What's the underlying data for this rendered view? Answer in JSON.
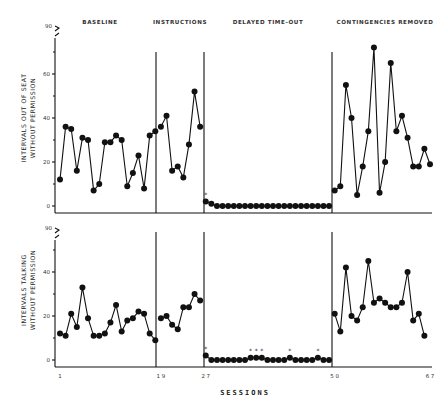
{
  "chart_data": [
    {
      "type": "line",
      "title": "",
      "xlabel": "SESSIONS",
      "ylabel": "INTERVALS OUT OF SEAT WITHOUT PERMISSION",
      "ylabel_lines": [
        "INTERVALS OUT OF SEAT",
        "WITHOUT PERMISSION"
      ],
      "y_ticks": [
        "0",
        "20",
        "40",
        "60"
      ],
      "y_break_label": "90",
      "ylim": [
        0,
        90
      ],
      "x_ticks": [
        "1",
        "19",
        "27",
        "50",
        "67"
      ],
      "phases": [
        "BASELINE",
        "INSTRUCTIONS",
        "DELAYED TIME-OUT",
        "CONTINGENCIES REMOVED"
      ],
      "phase_starts": [
        1,
        19,
        27,
        50
      ],
      "series": [
        {
          "name": "BASELINE",
          "x_start": 1,
          "values": [
            12,
            36,
            35,
            16,
            31,
            30,
            7,
            10,
            29,
            29,
            32,
            30,
            9,
            15,
            23,
            8,
            32,
            34
          ]
        },
        {
          "name": "INSTRUCTIONS",
          "x_start": 19,
          "values": [
            36,
            41,
            16,
            18,
            13,
            28,
            52,
            36
          ]
        },
        {
          "name": "DELAYED TIME-OUT",
          "x_start": 27,
          "values": [
            2,
            1,
            0,
            0,
            0,
            0,
            0,
            0,
            0,
            0,
            0,
            0,
            0,
            0,
            0,
            0,
            0,
            0,
            0,
            0,
            0,
            0,
            0
          ],
          "asterisks_at": [
            27
          ]
        },
        {
          "name": "CONTINGENCIES REMOVED",
          "x_start": 50,
          "values": [
            7,
            9,
            55,
            40,
            5,
            18,
            34,
            72,
            6,
            20,
            65,
            34,
            41,
            31,
            18,
            18,
            26,
            19
          ]
        }
      ]
    },
    {
      "type": "line",
      "title": "",
      "xlabel": "SESSIONS",
      "ylabel": "INTERVALS TALKING WITHOUT PERMISSION",
      "ylabel_lines": [
        "INTERVALS TALKING",
        "WITHOUT PERMISSION"
      ],
      "y_ticks": [
        "0",
        "20",
        "40"
      ],
      "y_break_label": "90",
      "ylim": [
        0,
        90
      ],
      "x_ticks": [
        "1",
        "19",
        "27",
        "50",
        "67"
      ],
      "phases": [
        "BASELINE",
        "INSTRUCTIONS",
        "DELAYED TIME-OUT",
        "CONTINGENCIES REMOVED"
      ],
      "phase_starts": [
        1,
        19,
        27,
        50
      ],
      "series": [
        {
          "name": "BASELINE",
          "x_start": 1,
          "values": [
            12,
            11,
            21,
            15,
            33,
            19,
            11,
            11,
            12,
            17,
            25,
            13,
            18,
            19,
            22,
            21,
            12,
            9
          ]
        },
        {
          "name": "INSTRUCTIONS",
          "x_start": 19,
          "values": [
            19,
            20,
            16,
            14,
            24,
            24,
            30,
            27
          ]
        },
        {
          "name": "DELAYED TIME-OUT",
          "x_start": 27,
          "values": [
            2,
            0,
            0,
            0,
            0,
            0,
            0,
            0,
            1,
            1,
            1,
            0,
            0,
            0,
            0,
            1,
            0,
            0,
            0,
            0,
            1,
            0,
            0
          ],
          "asterisks_at": [
            27,
            35,
            36,
            37,
            42,
            47
          ]
        },
        {
          "name": "CONTINGENCIES REMOVED",
          "x_start": 50,
          "values": [
            21,
            13,
            42,
            20,
            18,
            24,
            45,
            26,
            28,
            26,
            24,
            24,
            26,
            40,
            18,
            21,
            11
          ]
        }
      ]
    }
  ]
}
